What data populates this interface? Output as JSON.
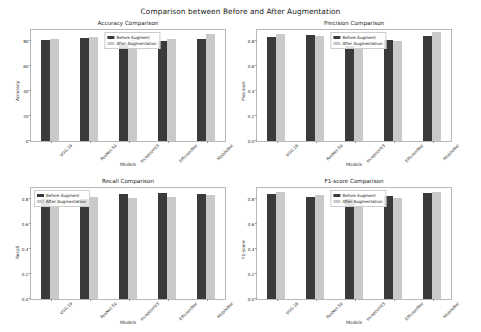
{
  "figure": {
    "suptitle": "Comparison between Before and After Augmentation",
    "xlabel": "Models",
    "legend": {
      "before": "Before Augment",
      "after": "After Augmentation"
    },
    "colors": {
      "before": "#3a3a3a",
      "after": "#c9c9c9",
      "axis": "#b8b8b8",
      "text": "#1a1a1a"
    }
  },
  "chart_data": [
    {
      "type": "bar",
      "title": "Accuracy Comparison",
      "xlabel": "Models",
      "ylabel": "Accuracy",
      "categories": [
        "VGG-19",
        "ResNet-50",
        "InceptionV3",
        "EfficientNet",
        "MobileNet"
      ],
      "ylim": [
        0,
        90
      ],
      "yticks": [
        0,
        20,
        40,
        60,
        80
      ],
      "ytick_labels": [
        "0",
        "20",
        "40",
        "60",
        "80"
      ],
      "grid": false,
      "legend_position": "upper center",
      "series": [
        {
          "name": "Before Augment",
          "values": [
            80.5,
            82.0,
            76.5,
            79.5,
            81.5
          ]
        },
        {
          "name": "After Augmentation",
          "values": [
            81.0,
            82.5,
            80.5,
            81.0,
            85.5
          ]
        }
      ]
    },
    {
      "type": "bar",
      "title": "Precision Comparison",
      "xlabel": "Models",
      "ylabel": "Precision",
      "categories": [
        "VGG-19",
        "ResNet-50",
        "InceptionV3",
        "EfficientNet",
        "MobileNet"
      ],
      "ylim": [
        0.0,
        0.9
      ],
      "yticks": [
        0.0,
        0.2,
        0.4,
        0.6,
        0.8
      ],
      "ytick_labels": [
        "0.0",
        "0.2",
        "0.4",
        "0.6",
        "0.8"
      ],
      "grid": false,
      "legend_position": "upper center",
      "series": [
        {
          "name": "Before Augment",
          "values": [
            0.825,
            0.845,
            0.755,
            0.805,
            0.84
          ]
        },
        {
          "name": "After Augmentation",
          "values": [
            0.855,
            0.835,
            0.765,
            0.8,
            0.865
          ]
        }
      ]
    },
    {
      "type": "bar",
      "title": "Recall Comparison",
      "xlabel": "Models",
      "ylabel": "Recall",
      "categories": [
        "VGG-19",
        "ResNet-50",
        "InceptionV3",
        "EfficientNet",
        "MobileNet"
      ],
      "ylim": [
        0.0,
        0.9
      ],
      "yticks": [
        0.0,
        0.2,
        0.4,
        0.6,
        0.8
      ],
      "ytick_labels": [
        "0.0",
        "0.2",
        "0.4",
        "0.6",
        "0.8"
      ],
      "grid": false,
      "legend_position": "upper left",
      "series": [
        {
          "name": "Before Augment",
          "values": [
            0.8,
            0.8,
            0.835,
            0.845,
            0.835
          ]
        },
        {
          "name": "After Augmentation",
          "values": [
            0.805,
            0.81,
            0.805,
            0.81,
            0.825
          ]
        }
      ]
    },
    {
      "type": "bar",
      "title": "F1-score Comparison",
      "xlabel": "Models",
      "ylabel": "F1-score",
      "categories": [
        "VGG-19",
        "ResNet-50",
        "InceptionV3",
        "EfficientNet",
        "MobileNet"
      ],
      "ylim": [
        0.0,
        0.9
      ],
      "yticks": [
        0.0,
        0.2,
        0.4,
        0.6,
        0.8
      ],
      "ytick_labels": [
        "0.0",
        "0.2",
        "0.4",
        "0.6",
        "0.8"
      ],
      "grid": false,
      "legend_position": "upper center",
      "series": [
        {
          "name": "Before Augment",
          "values": [
            0.835,
            0.815,
            0.795,
            0.82,
            0.845
          ]
        },
        {
          "name": "After Augmentation",
          "values": [
            0.85,
            0.825,
            0.785,
            0.805,
            0.855
          ]
        }
      ]
    }
  ]
}
